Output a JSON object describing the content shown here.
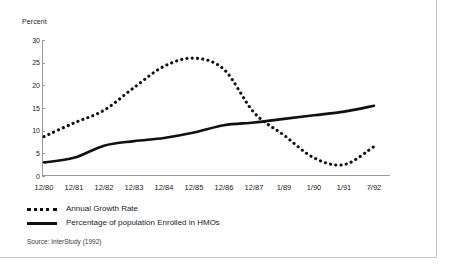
{
  "figure": {
    "source_note": "Source: InterStudy (1992)"
  },
  "chart_data": {
    "type": "line",
    "title": "",
    "subtitle": "",
    "xlabel": "",
    "ylabel": "Percent",
    "ylim": [
      0,
      30
    ],
    "yticks": [
      "0",
      "5",
      "10",
      "15",
      "20",
      "25",
      "30"
    ],
    "grid": false,
    "legend_position": "below",
    "categories": [
      "12/80",
      "12/81",
      "12/82",
      "12/83",
      "12/84",
      "12/85",
      "12/86",
      "12/87",
      "1/89",
      "1/90",
      "1/91",
      "7/92"
    ],
    "series": [
      {
        "name": "Annual Growth Rate",
        "style": "dotted",
        "color": "#111111",
        "values": [
          8.7,
          11.7,
          14.5,
          19.5,
          24.2,
          26.0,
          23.5,
          14.0,
          9.0,
          4.0,
          2.5,
          6.5
        ]
      },
      {
        "name": "Percentage of population Enrolled in HMOs",
        "style": "solid",
        "color": "#111111",
        "values": [
          3.0,
          4.0,
          6.7,
          7.7,
          8.4,
          9.6,
          11.2,
          11.8,
          12.6,
          13.4,
          14.2,
          15.5
        ]
      }
    ]
  }
}
